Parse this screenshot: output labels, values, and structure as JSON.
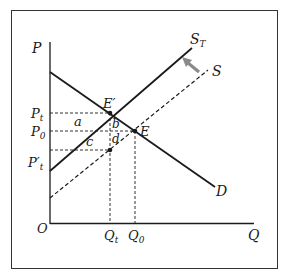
{
  "diagram": {
    "type": "supply-demand-tax",
    "axes": {
      "y_label": "P",
      "x_label": "Q",
      "origin_label": "O"
    },
    "curves": [
      {
        "id": "demand",
        "label": "D",
        "style": "solid"
      },
      {
        "id": "supply_after_tax",
        "label": "S",
        "subscript": "T",
        "style": "solid"
      },
      {
        "id": "supply",
        "label": "S",
        "style": "dashed"
      }
    ],
    "price_labels": [
      {
        "id": "p_t",
        "base": "P",
        "sub": "t"
      },
      {
        "id": "p_0",
        "base": "P",
        "sub": "0"
      },
      {
        "id": "p_t_prime",
        "base": "P′",
        "sub": "t"
      }
    ],
    "quantity_labels": [
      {
        "id": "q_t",
        "base": "Q",
        "sub": "t"
      },
      {
        "id": "q_0",
        "base": "Q",
        "sub": "0"
      }
    ],
    "points": [
      {
        "id": "e_prime",
        "label": "E′"
      },
      {
        "id": "e",
        "label": "E"
      }
    ],
    "areas": [
      "a",
      "b",
      "c",
      "d"
    ],
    "arrow": {
      "direction": "shift-up-left",
      "color": "#8a8a8a"
    },
    "colors": {
      "line": "#1a1a1a",
      "frame": "#333333",
      "arrow": "#8a8a8a"
    }
  }
}
